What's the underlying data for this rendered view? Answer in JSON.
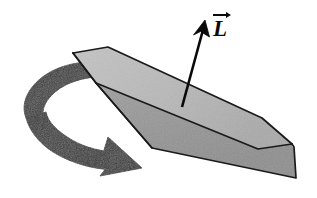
{
  "figure": {
    "background_color": "#ffffff",
    "width": 317,
    "height": 198
  },
  "labels": {
    "angular_momentum": {
      "symbol": "L",
      "accent": "vector-arrow",
      "text": "L",
      "x": 212,
      "y": 11,
      "color": "#0a0a0a"
    }
  },
  "disk": {
    "name": "spinning-disk",
    "top_face_color": "#b8b8b8",
    "side_face_color": "#9b9b9b",
    "outline_color": "#1a1a1a",
    "outline_width": 1.6,
    "top_face_points": "73,53 108,47 262,118 290,143 258,149 96,83",
    "side_face_points": "73,53 96,83 152,148 296,178 294,146 290,143 262,118 108,47",
    "near_rim_points": "96,83 152,148 296,178 294,146 290,143 262,118",
    "left_cap_points": "73,53 96,83 152,148 150,110"
  },
  "spin_arrow": {
    "name": "rotation-arrow",
    "fill_color": "#3a3a3a",
    "description": "thick curved band arrow wrapping counterclockwise around the left side of the disk indicating spin direction",
    "head_tip_x": 142,
    "head_tip_y": 168
  },
  "momentum_arrow": {
    "name": "angular-momentum-arrow",
    "color": "#0a0a0a",
    "tail_x": 182,
    "tail_y": 107,
    "tip_x": 205,
    "tip_y": 21,
    "shaft_width": 2.6
  }
}
